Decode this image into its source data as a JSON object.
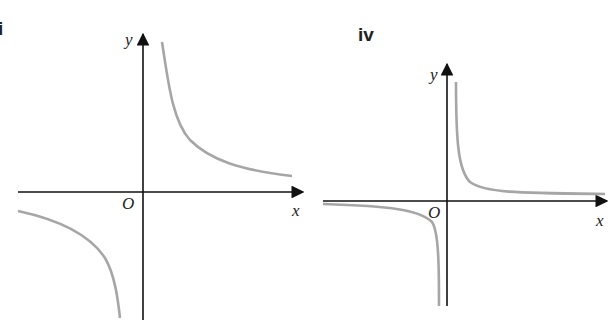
{
  "graphs": [
    {
      "label": "iii",
      "visible_label": "i",
      "x_axis_label": "x",
      "y_axis_label": "y",
      "origin_label": "O",
      "curve_description": "rectangular hyperbola in 1st and 3rd quadrants, y = k/x, k > 0, moderate curvature",
      "curve_color": "#a6a6a6",
      "axis_color": "#111111"
    },
    {
      "label": "iv",
      "visible_label": "iv",
      "x_axis_label": "x",
      "y_axis_label": "y",
      "origin_label": "O",
      "curve_description": "rectangular hyperbola in 1st and 3rd quadrants, y = k/x, small k > 0, tightly hugging axes",
      "curve_color": "#a6a6a6",
      "axis_color": "#111111"
    }
  ]
}
